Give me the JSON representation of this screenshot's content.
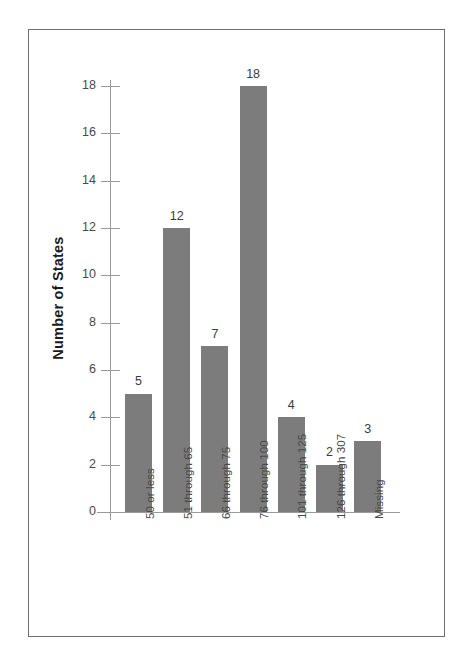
{
  "figure": {
    "frame_color": "#6e6e6e",
    "background": "#ffffff"
  },
  "chart_data": {
    "type": "bar",
    "title": "",
    "xlabel": "",
    "ylabel": "Number of States",
    "categories": [
      "50 or less",
      "51 through 65",
      "66 through 75",
      "76 through 100",
      "101 through 125",
      "126 through 307",
      "Missing"
    ],
    "values": [
      5,
      12,
      7,
      18,
      4,
      2,
      3
    ],
    "value_labels": [
      "5",
      "12",
      "7",
      "18",
      "4",
      "2",
      "3"
    ],
    "ylim": [
      0,
      18
    ],
    "ytick_values": [
      0,
      2,
      4,
      6,
      8,
      10,
      12,
      14,
      16,
      18
    ],
    "ytick_labels": [
      "0",
      "2",
      "4",
      "6",
      "8",
      "10",
      "12",
      "14",
      "16",
      "18"
    ],
    "grid": false,
    "legend": "none",
    "bar_color": "#7c7c7c",
    "axis_color": "#9a9a9a",
    "tick_label_color": "#4a4a4a",
    "value_label_color": "#3c3c3c",
    "category_label_rotation": "-90",
    "ylabel_rotation": "-90"
  }
}
